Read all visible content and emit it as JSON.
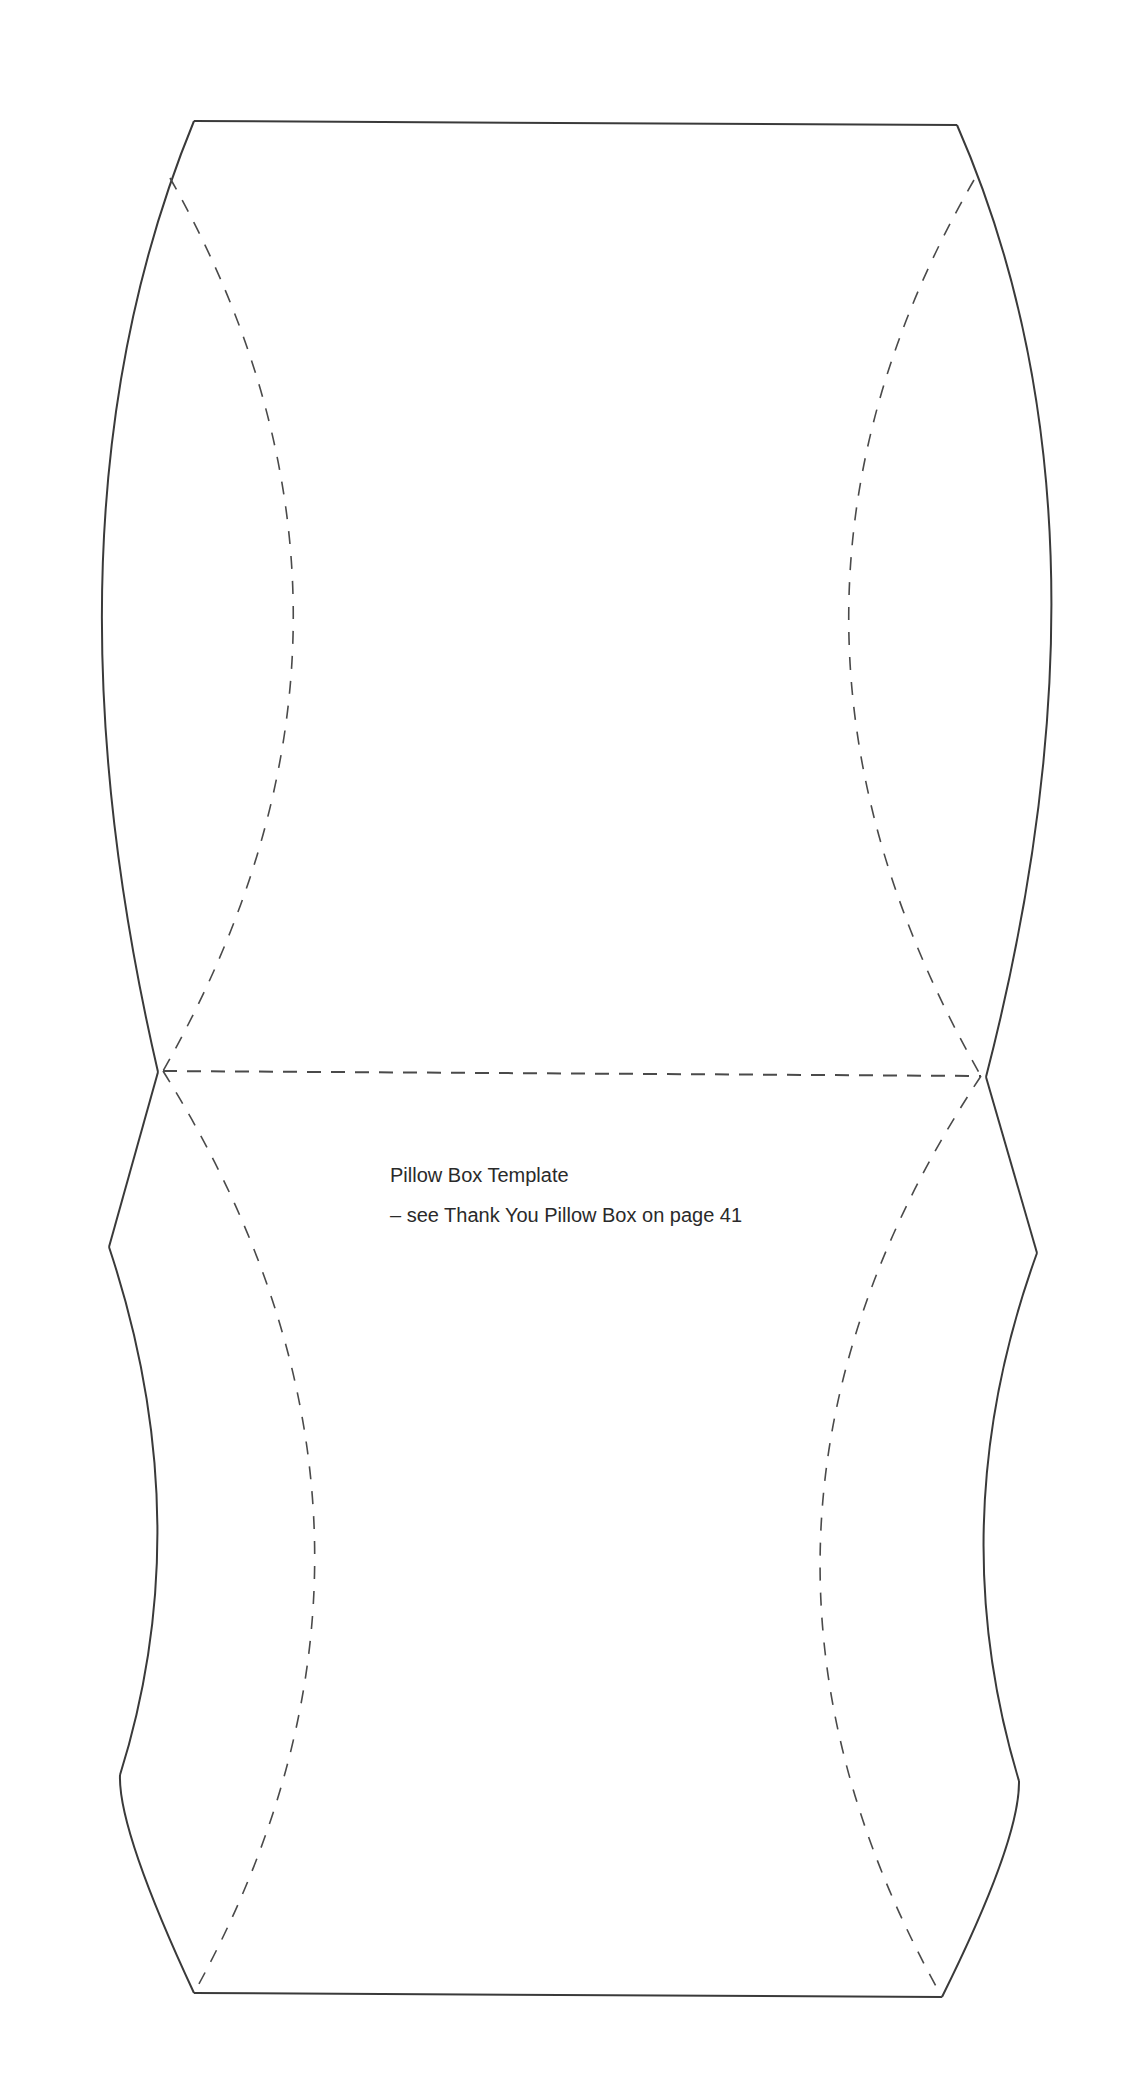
{
  "document": {
    "title": "Pillow Box Template",
    "subtitle": "– see Thank You Pillow Box on page 41"
  },
  "template": {
    "line_color": "#3a3a3a",
    "cut_line_style": "solid",
    "fold_line_style": "dashed"
  }
}
